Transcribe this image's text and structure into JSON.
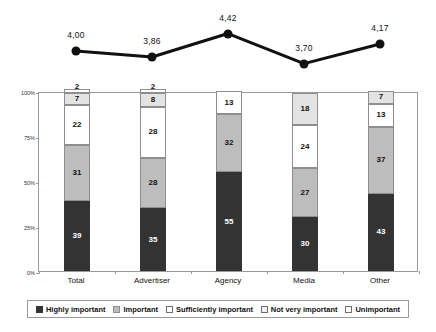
{
  "chart_data": {
    "type": "bar",
    "title": "",
    "subtitle": "",
    "xlabel": "",
    "ylabel": "",
    "ylim": [
      0,
      100
    ],
    "grid": false,
    "legend_position": "bottom",
    "categories": [
      "Total",
      "Advertiser",
      "Agency",
      "Media",
      "Other"
    ],
    "ytick_labels": [
      "0%",
      "25%",
      "50%",
      "75%",
      "100%"
    ],
    "ytick_values": [
      0,
      25,
      50,
      75,
      100
    ],
    "series": [
      {
        "name": "Highly important",
        "values": [
          39,
          35,
          55,
          30,
          43
        ],
        "color": "#333333"
      },
      {
        "name": "Important",
        "values": [
          31,
          28,
          32,
          27,
          37
        ],
        "color": "#bdbdbd"
      },
      {
        "name": "Sufficiently important",
        "values": [
          22,
          28,
          13,
          24,
          13
        ],
        "color": "#ffffff"
      },
      {
        "name": "Not very important",
        "values": [
          7,
          8,
          0,
          18,
          7
        ],
        "color": "#e3e3e3"
      },
      {
        "name": "Unimportant",
        "values": [
          2,
          2,
          0,
          0,
          0
        ],
        "color": "#ffffff"
      }
    ],
    "overlay_line": {
      "type": "line",
      "name": "Mean score",
      "marker": "filled-circle",
      "color": "#111111",
      "values": [
        4.0,
        3.86,
        4.42,
        3.7,
        4.17
      ],
      "value_labels": [
        "4,00",
        "3,86",
        "4,42",
        "3,70",
        "4,17"
      ],
      "ylim": [
        3.5,
        4.6
      ]
    }
  },
  "legend": {
    "items": [
      {
        "label": "Highly important",
        "swatch": "legend-swatch-highly-important"
      },
      {
        "label": "Important",
        "swatch": "legend-swatch-important"
      },
      {
        "label": "Sufficiently important",
        "swatch": "legend-swatch-sufficiently-important"
      },
      {
        "label": "Not very important",
        "swatch": "legend-swatch-not-very-important"
      },
      {
        "label": "Unimportant",
        "swatch": "legend-swatch-unimportant"
      }
    ]
  }
}
